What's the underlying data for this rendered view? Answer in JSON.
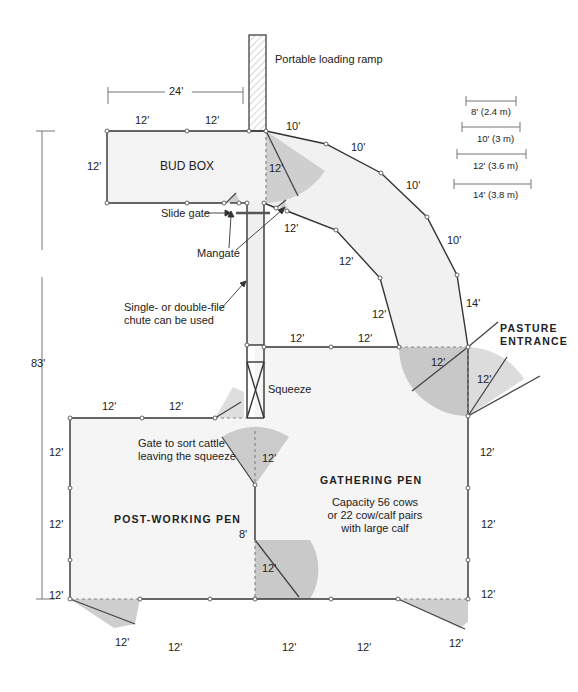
{
  "colors": {
    "line": "#333333",
    "pen_fill": "#f4f4f4",
    "gate_swing_dark": "#c9c9c9",
    "gate_swing_light": "#dedede",
    "dimension_line": "#777777"
  },
  "scale_legend": [
    {
      "label": "8' (2.4 m)"
    },
    {
      "label": "10' (3 m)"
    },
    {
      "label": "12' (3.6 m)"
    },
    {
      "label": "14' (3.8 m)"
    }
  ],
  "overall": {
    "height_dim": "83'",
    "top_dim": "24'"
  },
  "labels": {
    "loading_ramp": "Portable loading ramp",
    "bud_box": "BUD BOX",
    "slide_gate": "Slide gate",
    "mangate": "Mangate",
    "chute_note_line1": "Single- or double-file",
    "chute_note_line2": "chute can be used",
    "squeeze": "Squeeze",
    "pasture_line1": "PASTURE",
    "pasture_line2": "ENTRANCE",
    "sort_gate_line1": "Gate to sort cattle",
    "sort_gate_line2": "leaving the squeeze",
    "post_working_pen": "POST-WORKING PEN",
    "gathering_pen": "GATHERING PEN",
    "capacity_line1": "Capacity 56 cows",
    "capacity_line2": "or 22 cow/calf pairs",
    "capacity_line3": "with large calf"
  },
  "dimensions": {
    "bud_top_1": "12'",
    "bud_top_2": "12'",
    "bud_left": "12'",
    "bud_gate": "12'",
    "alley_outer_1": "10'",
    "alley_outer_2": "10'",
    "alley_outer_3": "10'",
    "alley_outer_4": "10'",
    "alley_outer_5": "14'",
    "alley_inner_1": "12'",
    "alley_inner_2": "12'",
    "alley_inner_3": "12'",
    "gather_top_1": "12'",
    "gather_top_2": "12'",
    "pasture_gate_1": "12'",
    "pasture_gate_2": "12'",
    "post_top_1": "12'",
    "post_top_2": "12'",
    "post_left_1": "12'",
    "post_left_2": "12'",
    "post_left_3": "12'",
    "sort_gate": "12'",
    "divider": "8'",
    "divider_gate": "12'",
    "gather_right_1": "12'",
    "gather_right_2": "12'",
    "gather_right_3": "12'",
    "bottom_gate_left": "12'",
    "bottom_1": "12'",
    "bottom_2": "12'",
    "bottom_3": "12'",
    "bottom_gate_right": "12'"
  }
}
